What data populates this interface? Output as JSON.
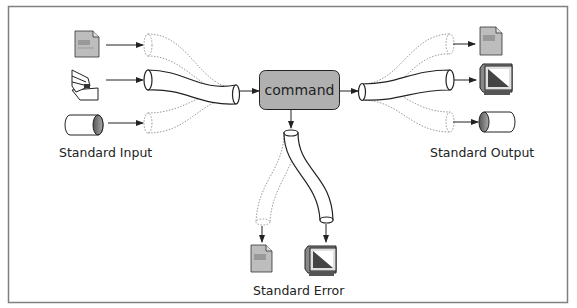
{
  "diagram": {
    "command_label": "command",
    "labels": {
      "standard_input": "Standard Input",
      "standard_output": "Standard Output",
      "standard_error": "Standard Error"
    },
    "colors": {
      "command_box": "#b0b0b0",
      "document": "#bdbdbd",
      "frame": "#808080"
    },
    "inputs": [
      "document-icon",
      "keyboard-hand-icon",
      "pipe-cylinder-icon"
    ],
    "outputs": [
      "document-icon",
      "monitor-icon",
      "pipe-cylinder-icon"
    ],
    "errors": [
      "document-icon",
      "monitor-icon"
    ]
  }
}
